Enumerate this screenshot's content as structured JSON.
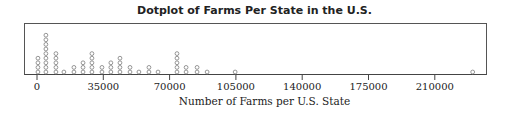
{
  "chart_data": {
    "type": "dotplot",
    "title": "Dotplot of Farms Per State in the U.S.",
    "xlabel": "Number of Farms per U.S. State",
    "ylabel": "",
    "xlim": [
      -1000,
      227000
    ],
    "xticks": [
      0,
      35000,
      70000,
      105000,
      140000,
      175000,
      210000
    ],
    "xtick_labels": [
      "0",
      "35000",
      "70000",
      "105000",
      "140000",
      "175000",
      "210000"
    ],
    "grid": false,
    "legend": null,
    "points": [
      {
        "x": 500,
        "count": 4
      },
      {
        "x": 4700,
        "count": 9
      },
      {
        "x": 10000,
        "count": 5
      },
      {
        "x": 14200,
        "count": 1
      },
      {
        "x": 19500,
        "count": 2
      },
      {
        "x": 24300,
        "count": 3
      },
      {
        "x": 29000,
        "count": 5
      },
      {
        "x": 34300,
        "count": 2
      },
      {
        "x": 39000,
        "count": 3
      },
      {
        "x": 43800,
        "count": 4
      },
      {
        "x": 49100,
        "count": 2
      },
      {
        "x": 53800,
        "count": 1
      },
      {
        "x": 59100,
        "count": 2
      },
      {
        "x": 63900,
        "count": 1
      },
      {
        "x": 73900,
        "count": 5
      },
      {
        "x": 78700,
        "count": 2
      },
      {
        "x": 84500,
        "count": 2
      },
      {
        "x": 89800,
        "count": 1
      },
      {
        "x": 104600,
        "count": 1
      },
      {
        "x": 230000,
        "count": 1
      }
    ],
    "total_points": 56
  },
  "axis": {
    "ticks": [
      {
        "value": 0,
        "label": "0"
      },
      {
        "value": 35000,
        "label": "35000"
      },
      {
        "value": 70000,
        "label": "70000"
      },
      {
        "value": 105000,
        "label": "105000"
      },
      {
        "value": 140000,
        "label": "140000"
      },
      {
        "value": 175000,
        "label": "175000"
      },
      {
        "value": 210000,
        "label": "210000"
      }
    ]
  },
  "colors": {
    "dot_stroke": "#8a8a8a",
    "axis": "#444444",
    "text": "#222222"
  }
}
